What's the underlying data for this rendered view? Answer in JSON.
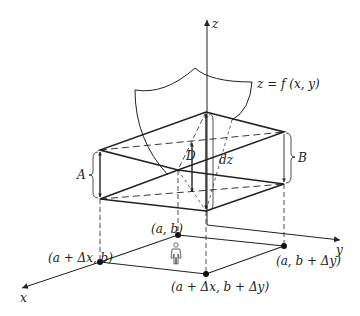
{
  "diagram": {
    "axes": {
      "z": "z",
      "x": "x",
      "y": "y"
    },
    "surface_label": "z = f (x, y)",
    "labels": {
      "A": "A",
      "B": "B",
      "D": "D",
      "dz": "dz"
    },
    "points": {
      "ab": "(a, b)",
      "a_dx_b": "(a + Δx, b)",
      "a_b_dy": "(a, b + Δy)",
      "a_dx_b_dy": "(a + Δx, b + Δy)"
    },
    "person_icon": "person-icon",
    "colors": {
      "line": "#222222",
      "background": "#ffffff"
    }
  }
}
